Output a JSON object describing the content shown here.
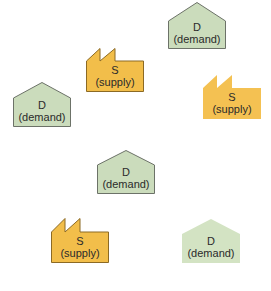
{
  "colors": {
    "demand_fill": "#cbdcbc",
    "demand_fill_light": "#d3e3c3",
    "demand_stroke": "#6c7268",
    "supply_fill": "#f2be4a",
    "supply_fill_light": "#f4c152",
    "supply_stroke": "#8c6a24",
    "background": "#ffffff"
  },
  "nodes": [
    {
      "type": "demand",
      "letter": "D",
      "name": "(demand)",
      "x": 168,
      "y": 2,
      "bordered": true
    },
    {
      "type": "supply",
      "letter": "S",
      "name": "(supply)",
      "x": 86,
      "y": 48,
      "bordered": true
    },
    {
      "type": "demand",
      "letter": "D",
      "name": "(demand)",
      "x": 13,
      "y": 82,
      "bordered": true
    },
    {
      "type": "supply",
      "letter": "S",
      "name": "(supply)",
      "x": 203,
      "y": 75,
      "bordered": false
    },
    {
      "type": "demand",
      "letter": "D",
      "name": "(demand)",
      "x": 97,
      "y": 150,
      "bordered": true
    },
    {
      "type": "supply",
      "letter": "S",
      "name": "(supply)",
      "x": 51,
      "y": 218,
      "bordered": true
    },
    {
      "type": "demand",
      "letter": "D",
      "name": "(demand)",
      "x": 182,
      "y": 219,
      "bordered": false
    }
  ]
}
